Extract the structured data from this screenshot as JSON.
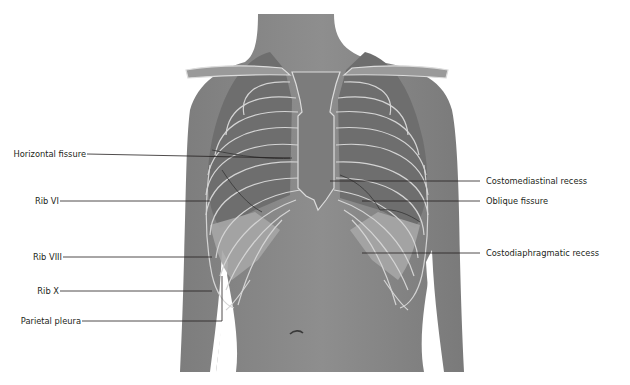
{
  "figure": {
    "colors": {
      "background": "#ffffff",
      "skin": "#8a8a8a",
      "skin_dark": "#6f6f6f",
      "lung": "#717171",
      "bone_outline": "#d8d8d8",
      "pleura_fill": "#a9a9a9",
      "leader_line": "#231f20",
      "label_text": "#231f20"
    }
  },
  "labels": {
    "left": [
      {
        "text": "Horizontal fissure",
        "y": 154
      },
      {
        "text": "Rib VI",
        "y": 201
      },
      {
        "text": "Rib VIII",
        "y": 257
      },
      {
        "text": "Rib X",
        "y": 291
      },
      {
        "text": "Parietal pleura",
        "y": 321
      }
    ],
    "right": [
      {
        "text": "Costomediastinal recess",
        "y": 181
      },
      {
        "text": "Oblique fissure",
        "y": 201
      },
      {
        "text": "Costodiaphragmatic recess",
        "y": 253
      }
    ]
  }
}
